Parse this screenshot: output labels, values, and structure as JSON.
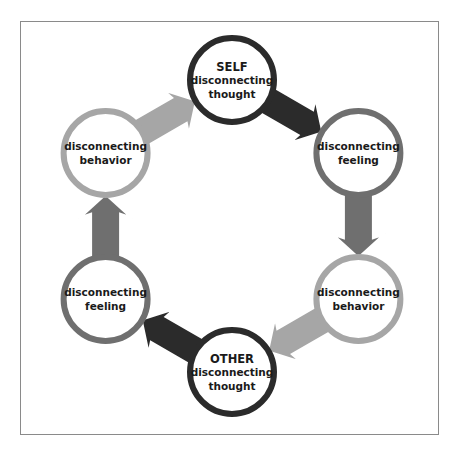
{
  "diagram": {
    "title": "",
    "colors": {
      "dark": "#2b2b2b",
      "medium": "#6f6f6f",
      "light": "#a6a6a6",
      "background": "#ffffff",
      "frame": "#8a8a8a",
      "text": "#1a1a1a"
    },
    "nodes": [
      {
        "id": "self-thought",
        "lines": [
          "SELF",
          "disconnecting",
          "thought"
        ],
        "tone": "dark"
      },
      {
        "id": "self-feeling",
        "lines": [
          "disconnecting",
          "feeling"
        ],
        "tone": "medium"
      },
      {
        "id": "self-behavior",
        "lines": [
          "disconnecting",
          "behavior"
        ],
        "tone": "light"
      },
      {
        "id": "other-thought",
        "lines": [
          "OTHER",
          "disconnecting",
          "thought"
        ],
        "tone": "dark"
      },
      {
        "id": "other-feeling",
        "lines": [
          "disconnecting",
          "feeling"
        ],
        "tone": "medium"
      },
      {
        "id": "other-behavior",
        "lines": [
          "disconnecting",
          "behavior"
        ],
        "tone": "light"
      }
    ],
    "edges": [
      {
        "from": "self-thought",
        "to": "self-feeling"
      },
      {
        "from": "self-feeling",
        "to": "self-behavior"
      },
      {
        "from": "self-behavior",
        "to": "other-thought"
      },
      {
        "from": "other-thought",
        "to": "other-feeling"
      },
      {
        "from": "other-feeling",
        "to": "other-behavior"
      },
      {
        "from": "other-behavior",
        "to": "self-thought"
      }
    ],
    "flow_direction": "clockwise"
  }
}
